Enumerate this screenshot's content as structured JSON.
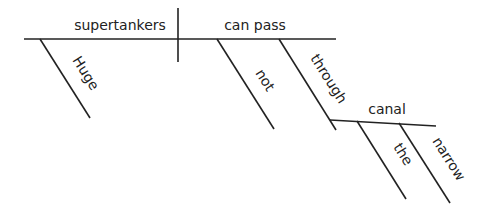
{
  "diagram": {
    "type": "sentence-diagram",
    "subject": "supertankers",
    "subject_modifiers": [
      "Huge"
    ],
    "predicate": "can pass",
    "predicate_modifiers": [
      "not",
      "through"
    ],
    "object_of_preposition": "canal",
    "object_modifiers": [
      "the",
      "narrow"
    ]
  },
  "labels": {
    "subject": "supertankers",
    "predicate": "can pass",
    "huge": "Huge",
    "not": "not",
    "through": "through",
    "canal": "canal",
    "the": "the",
    "narrow": "narrow"
  }
}
